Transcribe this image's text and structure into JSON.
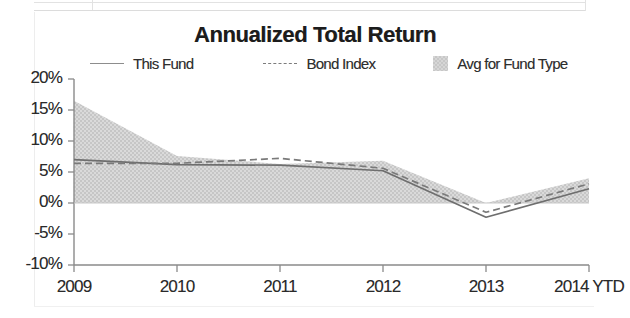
{
  "chart_data": {
    "type": "area",
    "title": "Annualized Total Return",
    "xlabel": "",
    "ylabel": "",
    "grid": false,
    "legend_position": "top",
    "x": [
      "2009",
      "2010",
      "2011",
      "2012",
      "2013",
      "2014 YTD"
    ],
    "categories": [
      "2009",
      "2010",
      "2011",
      "2012",
      "2013",
      "2014 YTD"
    ],
    "ylim": [
      -10,
      20
    ],
    "ytick_labels": [
      "20%",
      "15%",
      "10%",
      "5%",
      "0%",
      "-5%",
      "-10%"
    ],
    "ytick_values": [
      20,
      15,
      10,
      5,
      0,
      -5,
      -10
    ],
    "xtick_labels": [
      "2009",
      "2010",
      "2011",
      "2012",
      "2013",
      "2014 YTD"
    ],
    "series": [
      {
        "name": "This Fund",
        "style": "solid",
        "color": "#6e6e6e",
        "values": [
          7.0,
          6.2,
          6.1,
          5.2,
          -2.3,
          2.3
        ]
      },
      {
        "name": "Bond Index",
        "style": "dashed",
        "color": "#7a7a7a",
        "values": [
          6.4,
          6.4,
          7.2,
          5.6,
          -1.5,
          3.1
        ]
      },
      {
        "name": "Avg for Fund Type",
        "style": "band",
        "color": "#d2d2d2",
        "band_upper": [
          16.5,
          7.6,
          6.3,
          6.8,
          0.0,
          4.0
        ],
        "band_lower": [
          0.0,
          0.0,
          0.0,
          0.0,
          0.0,
          0.0
        ]
      }
    ]
  },
  "legend": {
    "items": [
      {
        "label": "This Fund",
        "swatch": "solid-line-swatch"
      },
      {
        "label": "Bond Index",
        "swatch": "dashed-line-swatch"
      },
      {
        "label": "Avg for Fund Type",
        "swatch": "shaded-area-swatch"
      }
    ]
  },
  "axes": {
    "y_labels": [
      "20%",
      "15%",
      "10%",
      "5%",
      "0%",
      "-5%",
      "-10%"
    ],
    "x_labels": [
      "2009",
      "2010",
      "2011",
      "2012",
      "2013",
      "2014 YTD"
    ]
  },
  "colors": {
    "band_fill": "#d2d2d2",
    "this_fund_line": "#6e6e6e",
    "bond_index_line": "#7a7a7a",
    "axis": "#8a8a8a",
    "text": "#2a2a2a"
  }
}
